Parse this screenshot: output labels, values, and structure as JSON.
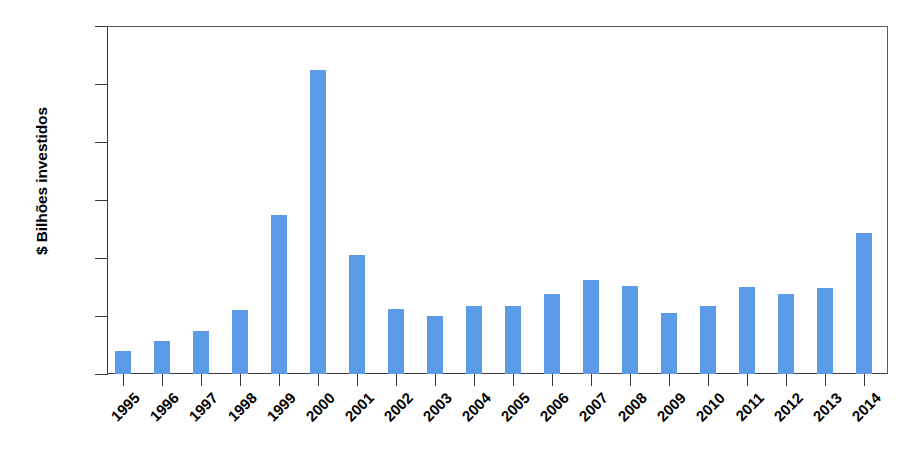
{
  "chart_data": {
    "type": "bar",
    "title": "",
    "subtitle": "",
    "xlabel": "",
    "ylabel": "$ Bilhões investidos",
    "ylim": [
      0,
      120
    ],
    "yticks": [
      0,
      20,
      40,
      60,
      80,
      100,
      120
    ],
    "ytick_labels": [
      "0",
      "20",
      "40",
      "60",
      "80",
      "100",
      "120"
    ],
    "grid": false,
    "legend": null,
    "bar_color": "#5b9be8",
    "axis_color": "#3b3b3b",
    "categories": [
      "1995",
      "1996",
      "1997",
      "1998",
      "1999",
      "2000",
      "2001",
      "2002",
      "2003",
      "2004",
      "2005",
      "2006",
      "2007",
      "2008",
      "2009",
      "2010",
      "2011",
      "2012",
      "2013",
      "2014"
    ],
    "values": [
      8,
      11.5,
      15,
      22,
      55,
      105,
      41,
      22.5,
      20,
      23.5,
      23.5,
      27.5,
      32.5,
      30.5,
      21,
      23.5,
      30,
      27.5,
      29.5,
      48.5
    ]
  }
}
